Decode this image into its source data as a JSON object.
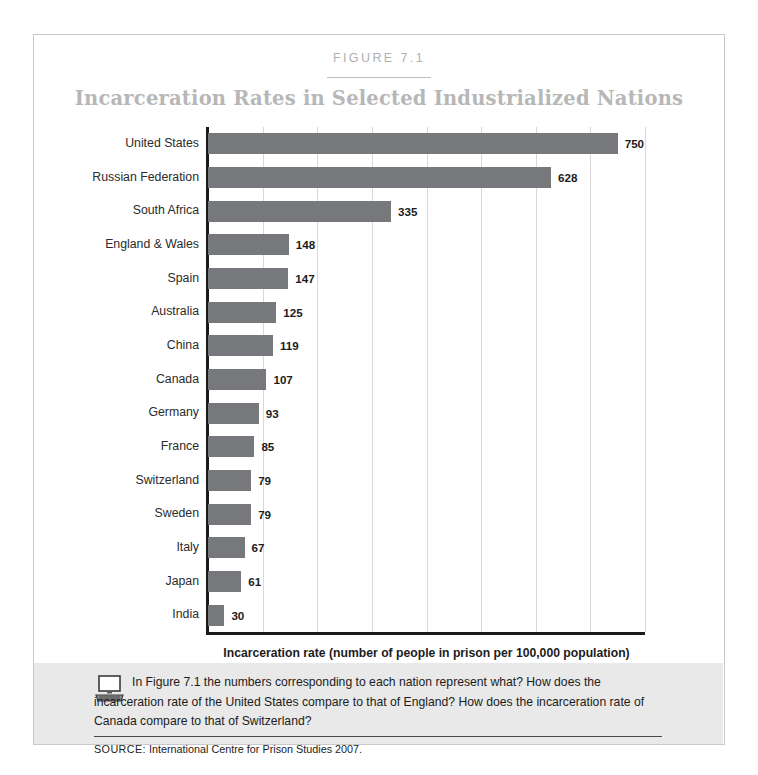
{
  "figure": {
    "label": "FIGURE 7.1",
    "title": "Incarceration Rates in Selected Industrialized Nations"
  },
  "chart_data": {
    "type": "bar",
    "orientation": "horizontal",
    "title": "Incarceration Rates in Selected Industrialized Nations",
    "xlabel": "Incarceration rate (number of people in prison per 100,000 population)",
    "ylabel": "",
    "xlim": [
      0,
      800
    ],
    "xticks": [
      0,
      100,
      200,
      300,
      400,
      500,
      600,
      700,
      800
    ],
    "grid": "vertical",
    "legend": "none",
    "bar_color": "#76787b",
    "categories": [
      "United States",
      "Russian Federation",
      "South Africa",
      "England & Wales",
      "Spain",
      "Australia",
      "China",
      "Canada",
      "Germany",
      "France",
      "Switzerland",
      "Sweden",
      "Italy",
      "Japan",
      "India"
    ],
    "values": [
      750,
      628,
      335,
      148,
      147,
      125,
      119,
      107,
      93,
      85,
      79,
      79,
      67,
      61,
      30
    ],
    "data_labels": [
      "750",
      "628",
      "335",
      "148",
      "147",
      "125",
      "119",
      "107",
      "93",
      "85",
      "79",
      "79",
      "67",
      "61",
      "30"
    ]
  },
  "question_box": {
    "icon": "computer-icon",
    "text": "In Figure 7.1 the numbers corresponding to each nation represent what? How does the incarceration rate of the United States compare to that of England? How does the incarceration rate of Canada compare to that of Switzerland?",
    "source_keyword": "SOURCE:",
    "source_text": "International Centre for Prison Studies 2007."
  },
  "colors": {
    "bar": "#76787b",
    "title": "#b7b7b7",
    "grid": "#d8d8d8",
    "axis": "#1a1a1a",
    "qbox_bg": "#e9e9e9"
  }
}
